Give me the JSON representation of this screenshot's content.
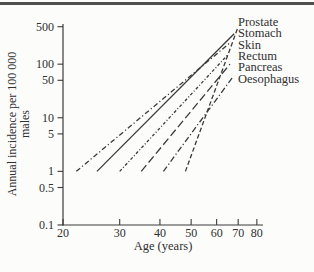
{
  "page": {
    "background": "#fcfcfb",
    "top_rule_color": "#4f4f4f",
    "ink_color": "#3a3a3a",
    "text_color": "#2f2f2f"
  },
  "chart_data": {
    "type": "line",
    "title": "",
    "xlabel": "Age (years)",
    "ylabel": "Annual incidence per 100 000 males",
    "ylabel_lines": [
      "Annual incidence per 100 000",
      "males"
    ],
    "x_scale": "log",
    "y_scale": "log",
    "grid": "off",
    "xlim": [
      20,
      84
    ],
    "ylim": [
      0.1,
      560
    ],
    "x_ticks": [
      20,
      30,
      40,
      50,
      60,
      70,
      80
    ],
    "y_ticks": [
      500,
      100,
      50,
      10,
      5,
      1,
      0.5,
      0.1
    ],
    "y_tick_labels": [
      "500",
      "100",
      "50",
      "10",
      "5",
      "1",
      "0.5",
      "0.1"
    ],
    "x_tick_labels": [
      "20",
      "30",
      "40",
      "50",
      "60",
      "70",
      "80"
    ],
    "legend_position": "right-of-line-tips",
    "label_order_top_to_bottom": [
      "Prostate",
      "Stomach",
      "Skin",
      "Rectum",
      "Pancreas",
      "Oesophagus"
    ],
    "series": [
      {
        "name": "Prostate",
        "line_style": "dashed",
        "dash": "4.5,2.5",
        "points": [
          [
            48,
            1
          ],
          [
            70,
            500
          ]
        ]
      },
      {
        "name": "Stomach",
        "line_style": "solid",
        "dash": "",
        "points": [
          [
            25.5,
            1
          ],
          [
            68,
            370
          ]
        ]
      },
      {
        "name": "Skin",
        "line_style": "dash-dot",
        "dash": "5,2.5,1.2,2.5",
        "points": [
          [
            22,
            1
          ],
          [
            66,
            250
          ]
        ]
      },
      {
        "name": "Rectum",
        "line_style": "fine-dash-dot",
        "dash": "3,2,1,2",
        "points": [
          [
            30,
            1
          ],
          [
            65,
            150
          ]
        ]
      },
      {
        "name": "Pancreas",
        "line_style": "long-dash",
        "dash": "8,3.5",
        "points": [
          [
            35,
            1
          ],
          [
            66,
            100
          ]
        ]
      },
      {
        "name": "Oesophagus",
        "line_style": "dash-dot",
        "dash": "6,2.5,1.2,2.5",
        "points": [
          [
            41,
            1
          ],
          [
            67,
            55
          ]
        ]
      }
    ]
  }
}
